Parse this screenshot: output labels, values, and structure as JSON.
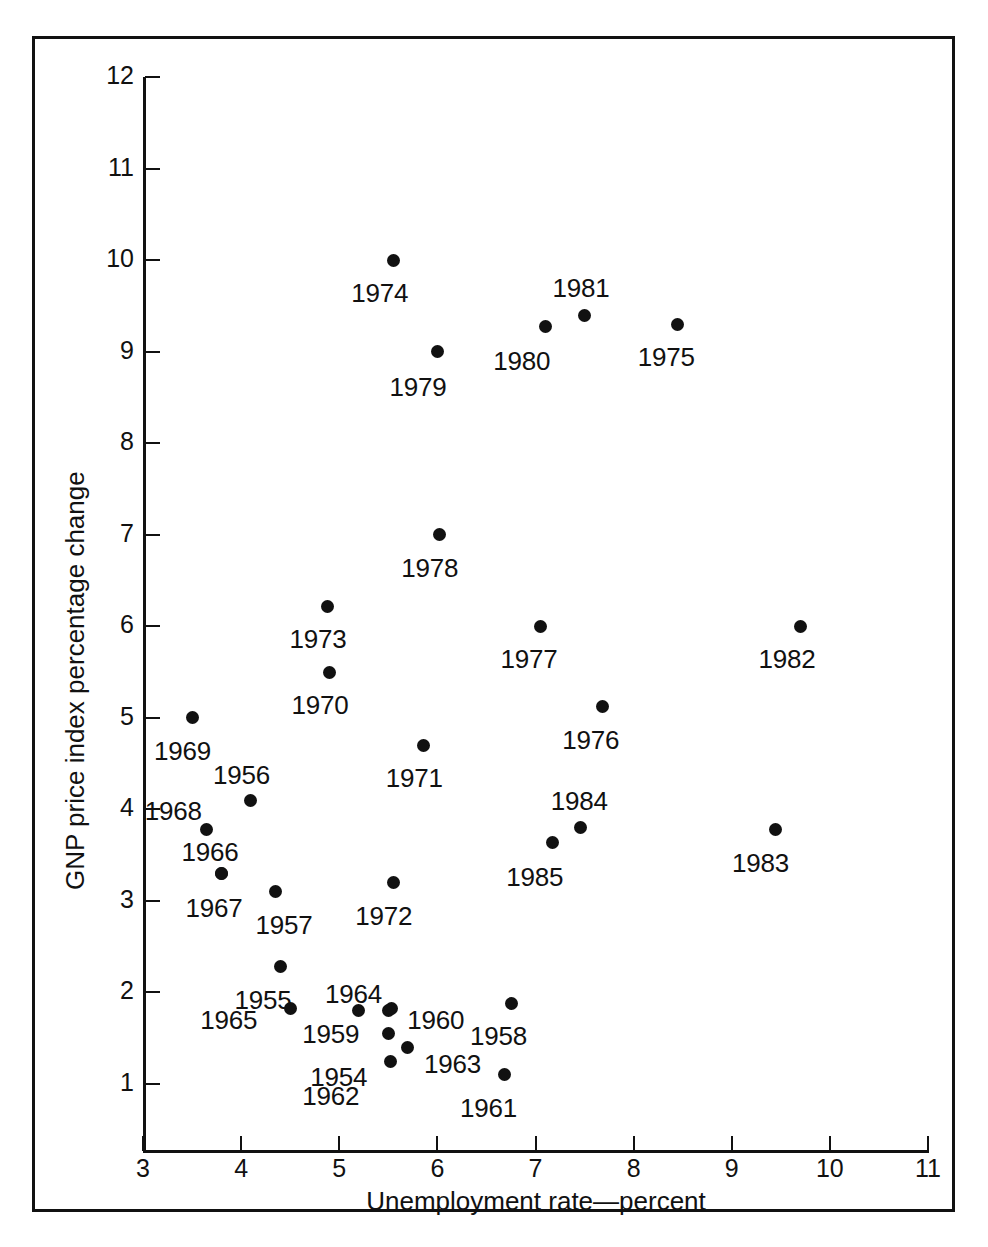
{
  "chart_data": {
    "type": "scatter",
    "title": "",
    "xlabel": "Unemployment rate—percent",
    "ylabel": "GNP price index percentage change",
    "xlim": [
      3,
      11
    ],
    "ylim": [
      0.6,
      12
    ],
    "xticks": [
      3,
      4,
      5,
      6,
      7,
      8,
      9,
      10,
      11
    ],
    "yticks": [
      1,
      2,
      3,
      4,
      5,
      6,
      7,
      8,
      9,
      10,
      11,
      12
    ],
    "grid": false,
    "legend": null,
    "marker_color": "#111111",
    "points": [
      {
        "label": "1954",
        "x": 5.5,
        "y": 1.55,
        "label_dx": -78,
        "label_dy": 28
      },
      {
        "label": "1955",
        "x": 4.4,
        "y": 2.28,
        "label_dx": -46,
        "label_dy": 18
      },
      {
        "label": "1956",
        "x": 4.1,
        "y": 4.1,
        "label_dx": -38,
        "label_dy": -40
      },
      {
        "label": "1957",
        "x": 4.35,
        "y": 3.1,
        "label_dx": -20,
        "label_dy": 18
      },
      {
        "label": "1958",
        "x": 6.76,
        "y": 1.88,
        "label_dx": -42,
        "label_dy": 18
      },
      {
        "label": "1959",
        "x": 5.5,
        "y": 1.8,
        "label_dx": -86,
        "label_dy": 8
      },
      {
        "label": "1960",
        "x": 5.53,
        "y": 1.82,
        "label_dx": 16,
        "label_dy": -4
      },
      {
        "label": "1961",
        "x": 6.68,
        "y": 1.1,
        "label_dx": -44,
        "label_dy": 18
      },
      {
        "label": "1962",
        "x": 5.52,
        "y": 1.25,
        "label_dx": -88,
        "label_dy": 20
      },
      {
        "label": "1963",
        "x": 5.7,
        "y": 1.4,
        "label_dx": 16,
        "label_dy": 2
      },
      {
        "label": "1964",
        "x": 5.2,
        "y": 1.8,
        "label_dx": -34,
        "label_dy": -32
      },
      {
        "label": "1965",
        "x": 4.5,
        "y": 1.82,
        "label_dx": -90,
        "label_dy": -4
      },
      {
        "label": "1966",
        "x": 3.8,
        "y": 3.3,
        "label_dx": -40,
        "label_dy": -36
      },
      {
        "label": "1967",
        "x": 3.8,
        "y": 3.3,
        "label_dx": -36,
        "label_dy": 20
      },
      {
        "label": "1968",
        "x": 3.65,
        "y": 3.78,
        "label_dx": -62,
        "label_dy": -34
      },
      {
        "label": "1969",
        "x": 3.5,
        "y": 5.0,
        "label_dx": -38,
        "label_dy": 18
      },
      {
        "label": "1970",
        "x": 4.9,
        "y": 5.5,
        "label_dx": -38,
        "label_dy": 18
      },
      {
        "label": "1971",
        "x": 5.86,
        "y": 4.7,
        "label_dx": -38,
        "label_dy": 18
      },
      {
        "label": "1972",
        "x": 5.55,
        "y": 3.2,
        "label_dx": -38,
        "label_dy": 18
      },
      {
        "label": "1973",
        "x": 4.88,
        "y": 6.22,
        "label_dx": -38,
        "label_dy": 18
      },
      {
        "label": "1974",
        "x": 5.55,
        "y": 10.0,
        "label_dx": -42,
        "label_dy": 18
      },
      {
        "label": "1975",
        "x": 8.45,
        "y": 9.3,
        "label_dx": -40,
        "label_dy": 18
      },
      {
        "label": "1976",
        "x": 7.68,
        "y": 5.12,
        "label_dx": -40,
        "label_dy": 18
      },
      {
        "label": "1977",
        "x": 7.05,
        "y": 6.0,
        "label_dx": -40,
        "label_dy": 18
      },
      {
        "label": "1978",
        "x": 6.02,
        "y": 7.0,
        "label_dx": -38,
        "label_dy": 18
      },
      {
        "label": "1979",
        "x": 6.0,
        "y": 9.0,
        "label_dx": -48,
        "label_dy": 20
      },
      {
        "label": "1980",
        "x": 7.1,
        "y": 9.28,
        "label_dx": -52,
        "label_dy": 20
      },
      {
        "label": "1981",
        "x": 7.5,
        "y": 9.4,
        "label_dx": -32,
        "label_dy": -42
      },
      {
        "label": "1982",
        "x": 9.7,
        "y": 6.0,
        "label_dx": -42,
        "label_dy": 18
      },
      {
        "label": "1983",
        "x": 9.45,
        "y": 3.78,
        "label_dx": -44,
        "label_dy": 18
      },
      {
        "label": "1984",
        "x": 7.46,
        "y": 3.8,
        "label_dx": -30,
        "label_dy": -42
      },
      {
        "label": "1985",
        "x": 7.17,
        "y": 3.64,
        "label_dx": -46,
        "label_dy": 20
      }
    ]
  }
}
